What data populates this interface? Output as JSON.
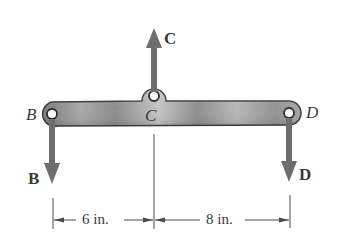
{
  "diagram": {
    "type": "free-body diagram of a beam",
    "colors": {
      "beam_fill": "#8a8a8a",
      "beam_highlight": "#c8c8c8",
      "arrow": "#6e6e6e",
      "line": "#4a4a4a",
      "text": "#3a3a3a",
      "background": "#ffffff"
    },
    "points": {
      "B": {
        "label": "B"
      },
      "C": {
        "label": "C"
      },
      "D": {
        "label": "D"
      }
    },
    "forces": {
      "B": {
        "label": "B",
        "direction": "down"
      },
      "C": {
        "label": "C",
        "direction": "up"
      },
      "D": {
        "label": "D",
        "direction": "down"
      }
    },
    "dimensions": [
      {
        "label": "6 in.",
        "from": "B",
        "to": "C"
      },
      {
        "label": "8 in.",
        "from": "C",
        "to": "D"
      }
    ]
  }
}
